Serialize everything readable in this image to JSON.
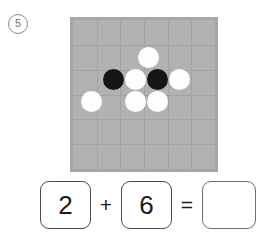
{
  "problem": {
    "number_label": "⑥",
    "number_text": "5"
  },
  "board": {
    "columns": 6,
    "rows": 6,
    "background_color": "#b2b2b2",
    "grid_line_color": "#a3a3a3",
    "border_color": "#a6a6a6",
    "black_stone_color": "#151515",
    "white_stone_color": "#fdfdfd",
    "black_count": 2,
    "white_count": 6,
    "stones": [
      {
        "name": "stone-white-top",
        "color": "white",
        "x": 65,
        "y": 27
      },
      {
        "name": "stone-black-mid-left",
        "color": "black",
        "x": 30,
        "y": 49
      },
      {
        "name": "stone-white-mid-left",
        "color": "white",
        "x": 52,
        "y": 49
      },
      {
        "name": "stone-black-mid-right",
        "color": "black",
        "x": 74,
        "y": 49
      },
      {
        "name": "stone-white-mid-right",
        "color": "white",
        "x": 96,
        "y": 49
      },
      {
        "name": "stone-white-bottom-1",
        "color": "white",
        "x": 8,
        "y": 71
      },
      {
        "name": "stone-white-bottom-2",
        "color": "white",
        "x": 52,
        "y": 71
      },
      {
        "name": "stone-white-bottom-3",
        "color": "white",
        "x": 74,
        "y": 71
      }
    ]
  },
  "equation": {
    "left_operand": "2",
    "operator_plus": "+",
    "right_operand": "6",
    "operator_equals": "=",
    "answer": ""
  }
}
